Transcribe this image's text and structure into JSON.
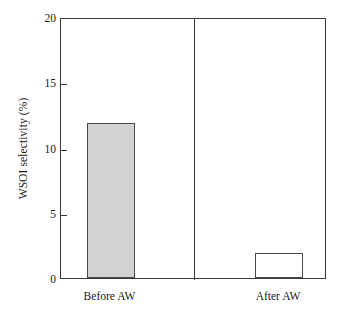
{
  "chart_data": {
    "type": "bar",
    "title": "",
    "xlabel": "",
    "ylabel": "WSOI selectivity (%)",
    "categories": [
      "Before AW",
      "After AW"
    ],
    "values": [
      11.9,
      1.9
    ],
    "ylim": [
      0,
      20
    ],
    "yticks": [
      0,
      5,
      10,
      15,
      20
    ],
    "ytick_labels": [
      "0",
      "5",
      "10",
      "15",
      "20"
    ],
    "grid": false,
    "legend": null,
    "bar_styles": [
      {
        "category": "Before AW",
        "fill": "#d2d2d2",
        "edge": "#4a4a4a"
      },
      {
        "category": "After AW",
        "fill": "#ffffff",
        "edge": "#4a4a4a"
      }
    ],
    "annotations": [],
    "group_divider": true
  },
  "colors": {
    "axis": "#3a3a3a",
    "bar_filled": "#d2d2d2",
    "bar_empty": "#ffffff",
    "bar_edge": "#4a4a4a",
    "text": "#1a1a1a",
    "background": "#ffffff"
  }
}
